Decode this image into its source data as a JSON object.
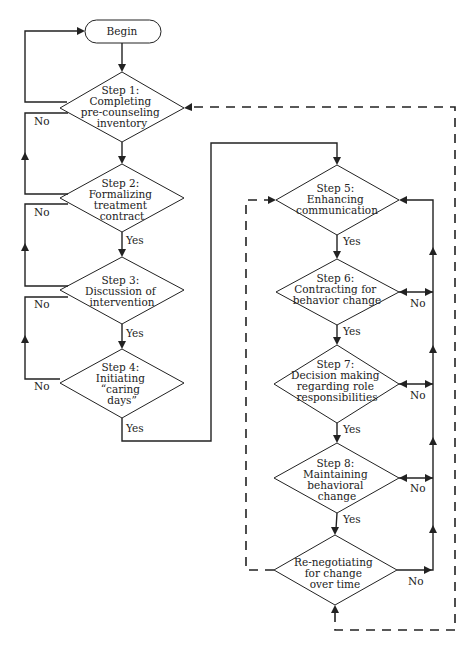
{
  "diagram": {
    "type": "flowchart",
    "nodes": {
      "begin": {
        "lines": [
          "Begin"
        ]
      },
      "step1": {
        "lines": [
          "Step 1:",
          "Completing",
          "pre-counseling",
          "inventory"
        ]
      },
      "step2": {
        "lines": [
          "Step 2:",
          "Formalizing",
          "treatment",
          "contract"
        ]
      },
      "step3": {
        "lines": [
          "Step 3:",
          "Discussion of",
          "intervention"
        ]
      },
      "step4": {
        "lines": [
          "Step 4:",
          "Initiating",
          "“caring",
          "days”"
        ]
      },
      "step5": {
        "lines": [
          "Step 5:",
          "Enhancing",
          "communication"
        ]
      },
      "step6": {
        "lines": [
          "Step 6:",
          "Contracting for",
          "behavior change"
        ]
      },
      "step7": {
        "lines": [
          "Step 7:",
          "Decision making",
          "regarding role",
          "responsibilities"
        ]
      },
      "step8": {
        "lines": [
          "Step 8:",
          "Maintaining",
          "behavioral",
          "change"
        ]
      },
      "step9": {
        "lines": [
          "Re-negotiating",
          "for change",
          "over time"
        ]
      }
    },
    "labels": {
      "yes": "Yes",
      "no": "No"
    },
    "edges": [
      {
        "from": "begin",
        "to": "step1",
        "style": "solid"
      },
      {
        "from": "step1",
        "to": "begin",
        "label": "No",
        "style": "solid"
      },
      {
        "from": "step1",
        "to": "step2",
        "style": "solid"
      },
      {
        "from": "step2",
        "to": "step1",
        "label": "No",
        "style": "solid"
      },
      {
        "from": "step2",
        "to": "step3",
        "label": "Yes",
        "style": "solid"
      },
      {
        "from": "step3",
        "to": "step2",
        "label": "No",
        "style": "solid"
      },
      {
        "from": "step3",
        "to": "step4",
        "label": "Yes",
        "style": "solid"
      },
      {
        "from": "step4",
        "to": "step3",
        "label": "No",
        "style": "solid"
      },
      {
        "from": "step4",
        "to": "step5",
        "label": "Yes",
        "style": "solid"
      },
      {
        "from": "step5",
        "to": "step6",
        "label": "Yes",
        "style": "solid"
      },
      {
        "from": "step6",
        "to": "step7",
        "label": "Yes",
        "style": "solid"
      },
      {
        "from": "step7",
        "to": "step8",
        "label": "Yes",
        "style": "solid"
      },
      {
        "from": "step8",
        "to": "step9",
        "label": "Yes",
        "style": "solid"
      },
      {
        "from": "step6",
        "to": "step5",
        "label": "No",
        "style": "solid"
      },
      {
        "from": "step7",
        "to": "step5",
        "label": "No",
        "style": "solid"
      },
      {
        "from": "step8",
        "to": "step5",
        "label": "No",
        "style": "solid"
      },
      {
        "from": "step9",
        "to": "step5",
        "label": "No",
        "style": "solid"
      },
      {
        "from": "step9",
        "to": "step5",
        "style": "dashed"
      },
      {
        "from": "step9",
        "to": "step1",
        "style": "dashed"
      }
    ]
  }
}
